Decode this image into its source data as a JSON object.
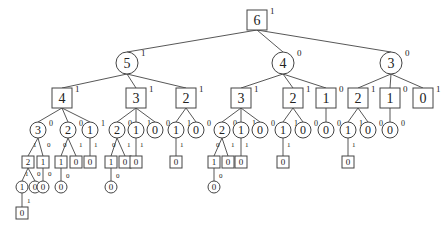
{
  "diagram": {
    "type": "tree",
    "colors": {
      "stroke": "#444444",
      "text": "#222222",
      "background": "#ffffff"
    },
    "nodes": [
      {
        "id": "n6",
        "val": "6",
        "shape": "box",
        "sup": "1",
        "x": 257,
        "y": 20,
        "size": "big"
      },
      {
        "id": "a5",
        "val": "5",
        "shape": "circle",
        "sup": "1",
        "x": 127,
        "y": 63,
        "size": "big",
        "parent": "n6"
      },
      {
        "id": "a4",
        "val": "4",
        "shape": "circle",
        "sup": "0",
        "x": 283,
        "y": 63,
        "size": "big",
        "parent": "n6"
      },
      {
        "id": "a3",
        "val": "3",
        "shape": "circle",
        "sup": "0",
        "x": 391,
        "y": 63,
        "size": "big",
        "parent": "n6"
      },
      {
        "id": "b54",
        "val": "4",
        "shape": "box",
        "sup": "1",
        "x": 62,
        "y": 98,
        "size": "big",
        "parent": "a5"
      },
      {
        "id": "b53",
        "val": "3",
        "shape": "box",
        "sup": "1",
        "x": 136,
        "y": 98,
        "size": "big",
        "parent": "a5"
      },
      {
        "id": "b52",
        "val": "2",
        "shape": "box",
        "sup": "1",
        "x": 186,
        "y": 98,
        "size": "big",
        "parent": "a5"
      },
      {
        "id": "b43",
        "val": "3",
        "shape": "box",
        "sup": "1",
        "x": 241,
        "y": 98,
        "size": "big",
        "parent": "a4"
      },
      {
        "id": "b42",
        "val": "2",
        "shape": "box",
        "sup": "1",
        "x": 293,
        "y": 98,
        "size": "big",
        "parent": "a4"
      },
      {
        "id": "b41",
        "val": "1",
        "shape": "box",
        "sup": "0",
        "x": 326,
        "y": 98,
        "size": "big",
        "parent": "a4"
      },
      {
        "id": "b32",
        "val": "2",
        "shape": "box",
        "sup": "1",
        "x": 358,
        "y": 98,
        "size": "big",
        "parent": "a3"
      },
      {
        "id": "b31",
        "val": "1",
        "shape": "box",
        "sup": "0",
        "x": 390,
        "y": 98,
        "size": "big",
        "parent": "a3"
      },
      {
        "id": "b30",
        "val": "0",
        "shape": "box",
        "sup": "1",
        "x": 423,
        "y": 98,
        "size": "big",
        "parent": "a3"
      },
      {
        "id": "c543",
        "val": "3",
        "shape": "circle",
        "sup": "0",
        "x": 38,
        "y": 130,
        "size": "mid",
        "parent": "b54"
      },
      {
        "id": "c542",
        "val": "2",
        "shape": "circle",
        "sup": "0",
        "x": 68,
        "y": 130,
        "size": "mid",
        "parent": "b54"
      },
      {
        "id": "c541",
        "val": "1",
        "shape": "circle",
        "sup": "1",
        "x": 90,
        "y": 130,
        "size": "mid",
        "parent": "b54"
      },
      {
        "id": "c532",
        "val": "2",
        "shape": "circle",
        "sup": "0",
        "x": 117,
        "y": 130,
        "size": "mid",
        "parent": "b53"
      },
      {
        "id": "c531",
        "val": "1",
        "shape": "circle",
        "sup": "1",
        "x": 136,
        "y": 130,
        "size": "mid",
        "parent": "b53"
      },
      {
        "id": "c530",
        "val": "0",
        "shape": "circle",
        "sup": "0",
        "x": 155,
        "y": 130,
        "size": "mid",
        "parent": "b53"
      },
      {
        "id": "c521",
        "val": "1",
        "shape": "circle",
        "sup": "1",
        "x": 176,
        "y": 130,
        "size": "mid",
        "parent": "b52"
      },
      {
        "id": "c520",
        "val": "0",
        "shape": "circle",
        "sup": "0",
        "x": 196,
        "y": 130,
        "size": "mid",
        "parent": "b52"
      },
      {
        "id": "c432",
        "val": "2",
        "shape": "circle",
        "sup": "0",
        "x": 222,
        "y": 130,
        "size": "mid",
        "parent": "b43"
      },
      {
        "id": "c431",
        "val": "1",
        "shape": "circle",
        "sup": "1",
        "x": 241,
        "y": 130,
        "size": "mid",
        "parent": "b43"
      },
      {
        "id": "c430",
        "val": "0",
        "shape": "circle",
        "sup": "0",
        "x": 260,
        "y": 130,
        "size": "mid",
        "parent": "b43"
      },
      {
        "id": "c421",
        "val": "1",
        "shape": "circle",
        "sup": "1",
        "x": 283,
        "y": 130,
        "size": "mid",
        "parent": "b42"
      },
      {
        "id": "c420",
        "val": "0",
        "shape": "circle",
        "sup": "0",
        "x": 303,
        "y": 130,
        "size": "mid",
        "parent": "b42"
      },
      {
        "id": "c410",
        "val": "0",
        "shape": "circle",
        "sup": "0",
        "x": 326,
        "y": 130,
        "size": "mid",
        "parent": "b41"
      },
      {
        "id": "c321",
        "val": "1",
        "shape": "circle",
        "sup": "1",
        "x": 348,
        "y": 130,
        "size": "mid",
        "parent": "b32"
      },
      {
        "id": "c320",
        "val": "0",
        "shape": "circle",
        "sup": "0",
        "x": 368,
        "y": 130,
        "size": "mid",
        "parent": "b32"
      },
      {
        "id": "c310",
        "val": "0",
        "shape": "circle",
        "sup": "0",
        "x": 390,
        "y": 130,
        "size": "mid",
        "parent": "b31"
      },
      {
        "id": "d5432",
        "val": "2",
        "shape": "box",
        "x": 28,
        "y": 162,
        "size": "small",
        "parent": "c543",
        "edge": "1"
      },
      {
        "id": "d5431",
        "val": "1",
        "shape": "box",
        "x": 43,
        "y": 162,
        "size": "small",
        "parent": "c543",
        "edge": "0"
      },
      {
        "id": "d5421",
        "val": "1",
        "shape": "box",
        "x": 61,
        "y": 162,
        "size": "small",
        "parent": "c542",
        "edge": "0"
      },
      {
        "id": "d5420",
        "val": "0",
        "shape": "box",
        "x": 76,
        "y": 162,
        "size": "small",
        "parent": "c542",
        "edge": "1"
      },
      {
        "id": "d5410",
        "val": "0",
        "shape": "box",
        "x": 90,
        "y": 162,
        "size": "small",
        "parent": "c541",
        "edge": "1"
      },
      {
        "id": "d5321",
        "val": "1",
        "shape": "box",
        "x": 111,
        "y": 162,
        "size": "small",
        "parent": "c532",
        "edge": "0"
      },
      {
        "id": "d5320",
        "val": "0",
        "shape": "box",
        "x": 125,
        "y": 162,
        "size": "small",
        "parent": "c532",
        "edge": "1"
      },
      {
        "id": "d5310",
        "val": "0",
        "shape": "box",
        "x": 136,
        "y": 162,
        "size": "small",
        "parent": "c531",
        "edge": "1"
      },
      {
        "id": "d5210",
        "val": "0",
        "shape": "box",
        "x": 176,
        "y": 162,
        "size": "small",
        "parent": "c521",
        "edge": "1"
      },
      {
        "id": "d4321",
        "val": "1",
        "shape": "box",
        "x": 214,
        "y": 162,
        "size": "small",
        "parent": "c432",
        "edge": "0"
      },
      {
        "id": "d4320",
        "val": "0",
        "shape": "box",
        "x": 228,
        "y": 162,
        "size": "small",
        "parent": "c432",
        "edge": "1"
      },
      {
        "id": "d4310",
        "val": "0",
        "shape": "box",
        "x": 241,
        "y": 162,
        "size": "small",
        "parent": "c431",
        "edge": "1"
      },
      {
        "id": "d4210",
        "val": "0",
        "shape": "box",
        "x": 283,
        "y": 162,
        "size": "small",
        "parent": "c421",
        "edge": "1"
      },
      {
        "id": "d3210",
        "val": "0",
        "shape": "box",
        "x": 348,
        "y": 162,
        "size": "small",
        "parent": "c321",
        "edge": "1"
      },
      {
        "id": "e54321",
        "val": "1",
        "shape": "circle",
        "x": 22,
        "y": 187,
        "size": "small",
        "parent": "d5432",
        "edge": "1"
      },
      {
        "id": "e54320",
        "val": "0",
        "shape": "circle",
        "x": 35,
        "y": 187,
        "size": "small",
        "parent": "d5432",
        "edge": "0"
      },
      {
        "id": "e54310",
        "val": "0",
        "shape": "circle",
        "x": 43,
        "y": 187,
        "size": "small",
        "parent": "d5431",
        "edge": "0"
      },
      {
        "id": "e54210",
        "val": "0",
        "shape": "circle",
        "x": 61,
        "y": 187,
        "size": "small",
        "parent": "d5421",
        "edge": "0"
      },
      {
        "id": "e53210",
        "val": "0",
        "shape": "circle",
        "x": 111,
        "y": 187,
        "size": "small",
        "parent": "d5321",
        "edge": "0"
      },
      {
        "id": "e43210",
        "val": "0",
        "shape": "circle",
        "x": 214,
        "y": 187,
        "size": "small",
        "parent": "d4321",
        "edge": "0"
      },
      {
        "id": "f543210",
        "val": "0",
        "shape": "box",
        "x": 22,
        "y": 213,
        "size": "small",
        "parent": "e54321",
        "edge": "1"
      }
    ],
    "edge_labels": [
      {
        "text": "1",
        "x": 33,
        "y": 147
      },
      {
        "text": "0",
        "x": 47,
        "y": 147
      },
      {
        "text": "0",
        "x": 63,
        "y": 147
      },
      {
        "text": "1",
        "x": 79,
        "y": 147
      },
      {
        "text": "1",
        "x": 94,
        "y": 147
      },
      {
        "text": "0",
        "x": 112,
        "y": 147
      },
      {
        "text": "1",
        "x": 127,
        "y": 147
      },
      {
        "text": "1",
        "x": 140,
        "y": 147
      },
      {
        "text": "1",
        "x": 180,
        "y": 147
      },
      {
        "text": "0",
        "x": 216,
        "y": 147
      },
      {
        "text": "1",
        "x": 231,
        "y": 147
      },
      {
        "text": "1",
        "x": 245,
        "y": 147
      },
      {
        "text": "1",
        "x": 287,
        "y": 147
      },
      {
        "text": "1",
        "x": 352,
        "y": 147
      },
      {
        "text": "1",
        "x": 25,
        "y": 176
      },
      {
        "text": "0",
        "x": 37,
        "y": 176
      },
      {
        "text": "0",
        "x": 48,
        "y": 176
      },
      {
        "text": "0",
        "x": 66,
        "y": 178
      },
      {
        "text": "0",
        "x": 116,
        "y": 178
      },
      {
        "text": "0",
        "x": 219,
        "y": 178
      },
      {
        "text": "1",
        "x": 27,
        "y": 203
      }
    ]
  }
}
